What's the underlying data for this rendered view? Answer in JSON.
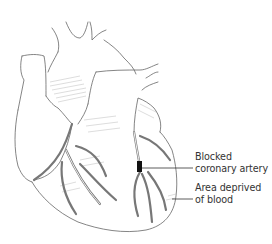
{
  "figure": {
    "labels": [
      {
        "id": "blocked",
        "lines": [
          "Blocked",
          "coronary artery"
        ]
      },
      {
        "id": "deprived",
        "lines": [
          "Area deprived",
          "of blood"
        ]
      }
    ],
    "colors": {
      "line": "#555555",
      "blockage": "#111111",
      "text": "#333333",
      "background": "#ffffff"
    }
  }
}
